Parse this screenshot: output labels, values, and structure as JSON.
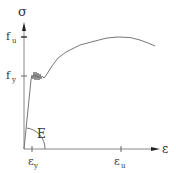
{
  "diagram": {
    "type": "stress-strain curve",
    "y_axis": {
      "symbol": "σ"
    },
    "x_axis": {
      "symbol": "ε"
    },
    "y_ticks": [
      {
        "label": "f",
        "sub": "u"
      },
      {
        "label": "f",
        "sub": "y"
      }
    ],
    "x_ticks": [
      {
        "label": "ε",
        "sub": "y"
      },
      {
        "label": "ε",
        "sub": "u"
      }
    ],
    "modulus_label": "E",
    "colors": {
      "line": "#666666",
      "axis": "#777777",
      "text": "#333333"
    }
  }
}
